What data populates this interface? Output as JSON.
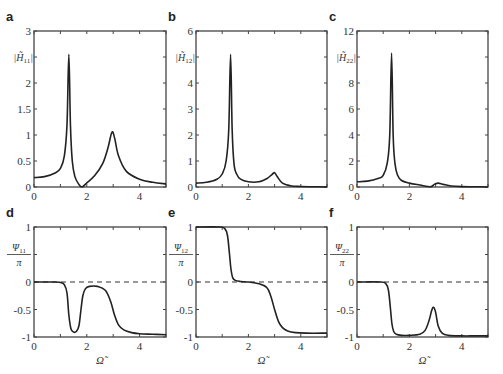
{
  "chart_data": [
    {
      "panel": "a",
      "type": "line",
      "ylabel": "|H̃11|",
      "xlabel": "",
      "xlim": [
        0,
        5
      ],
      "ylim": [
        0,
        3
      ],
      "xticks": [
        "0",
        "2",
        "4"
      ],
      "yticks": [
        "0",
        "0.5",
        "1",
        "1.5",
        "2",
        "2.5",
        "3"
      ],
      "x": [
        0,
        0.4,
        0.8,
        1.0,
        1.15,
        1.25,
        1.32,
        1.38,
        1.45,
        1.55,
        1.7,
        1.82,
        2.0,
        2.3,
        2.6,
        2.8,
        2.95,
        3.05,
        3.2,
        3.5,
        4.0,
        4.5,
        5.0
      ],
      "y": [
        0.18,
        0.2,
        0.27,
        0.36,
        0.6,
        1.2,
        2.55,
        1.2,
        0.5,
        0.2,
        0.05,
        0.0,
        0.08,
        0.22,
        0.45,
        0.75,
        1.05,
        0.95,
        0.6,
        0.3,
        0.15,
        0.09,
        0.06
      ]
    },
    {
      "panel": "b",
      "type": "line",
      "ylabel": "|H̃12|",
      "xlabel": "",
      "xlim": [
        0,
        5
      ],
      "ylim": [
        0,
        6
      ],
      "xticks": [
        "0",
        "2",
        "4"
      ],
      "yticks": [
        "0",
        "1",
        "2",
        "3",
        "4",
        "5",
        "6"
      ],
      "x": [
        0,
        0.4,
        0.8,
        1.0,
        1.15,
        1.25,
        1.32,
        1.38,
        1.45,
        1.55,
        1.7,
        2.0,
        2.4,
        2.7,
        2.9,
        3.0,
        3.1,
        3.3,
        3.6,
        4.0,
        4.5,
        5.0
      ],
      "y": [
        0.15,
        0.18,
        0.3,
        0.5,
        1.0,
        2.2,
        5.1,
        2.2,
        0.9,
        0.5,
        0.3,
        0.2,
        0.2,
        0.32,
        0.48,
        0.55,
        0.4,
        0.15,
        0.05,
        0.02,
        0.01,
        0.0
      ],
      "peak_x": 1.32,
      "peak_y": 5.1
    },
    {
      "panel": "c",
      "type": "line",
      "ylabel": "|H̃22|",
      "xlabel": "",
      "xlim": [
        0,
        5
      ],
      "ylim": [
        0,
        12
      ],
      "xticks": [
        "0",
        "2",
        "4"
      ],
      "yticks": [
        "0",
        "2",
        "4",
        "6",
        "8",
        "10",
        "12"
      ],
      "x": [
        0,
        0.4,
        0.8,
        1.0,
        1.15,
        1.25,
        1.32,
        1.38,
        1.45,
        1.55,
        1.7,
        2.0,
        2.4,
        2.8,
        2.95,
        3.1,
        3.3,
        3.6,
        4.0,
        4.5,
        5.0
      ],
      "y": [
        0.4,
        0.45,
        0.65,
        0.9,
        1.8,
        4.0,
        10.3,
        4.0,
        1.8,
        0.9,
        0.5,
        0.3,
        0.15,
        0.02,
        0.2,
        0.3,
        0.2,
        0.08,
        0.03,
        0.02,
        0.0
      ]
    },
    {
      "panel": "d",
      "type": "line",
      "ylabel": "Ψ11/π",
      "xlabel": "Ω̃",
      "xlim": [
        0,
        5
      ],
      "ylim": [
        -1,
        1
      ],
      "xticks": [
        "0",
        "2",
        "4"
      ],
      "yticks": [
        "-1",
        "-0.5",
        "0",
        "0.5",
        "1"
      ],
      "reference_line": {
        "y": 0,
        "style": "dashed"
      },
      "x": [
        0,
        0.8,
        1.0,
        1.15,
        1.25,
        1.32,
        1.4,
        1.5,
        1.6,
        1.7,
        1.78,
        1.85,
        1.95,
        2.1,
        2.4,
        2.7,
        2.9,
        3.05,
        3.2,
        3.4,
        3.7,
        4.0,
        4.5,
        5.0
      ],
      "y": [
        0,
        0,
        -0.01,
        -0.05,
        -0.2,
        -0.6,
        -0.85,
        -0.91,
        -0.9,
        -0.8,
        -0.5,
        -0.25,
        -0.12,
        -0.08,
        -0.08,
        -0.15,
        -0.35,
        -0.6,
        -0.78,
        -0.87,
        -0.92,
        -0.94,
        -0.95,
        -0.96
      ]
    },
    {
      "panel": "e",
      "type": "line",
      "ylabel": "Ψ12/π",
      "xlabel": "Ω̃",
      "xlim": [
        0,
        5
      ],
      "ylim": [
        -1,
        1
      ],
      "xticks": [
        "0",
        "2",
        "4"
      ],
      "yticks": [
        "-1",
        "-0.5",
        "0",
        "0.5",
        "1"
      ],
      "reference_line": {
        "y": 0,
        "style": "dashed"
      },
      "x": [
        0,
        0.9,
        1.1,
        1.2,
        1.28,
        1.33,
        1.4,
        1.5,
        1.7,
        2.0,
        2.4,
        2.7,
        2.85,
        3.0,
        3.15,
        3.3,
        3.5,
        3.8,
        4.2,
        5.0
      ],
      "y": [
        1.0,
        1.0,
        0.97,
        0.85,
        0.5,
        0.25,
        0.08,
        0.03,
        0.01,
        0.0,
        -0.03,
        -0.1,
        -0.25,
        -0.5,
        -0.72,
        -0.83,
        -0.89,
        -0.92,
        -0.93,
        -0.93
      ]
    },
    {
      "panel": "f",
      "type": "line",
      "ylabel": "Ψ22/π",
      "xlabel": "Ω̃",
      "xlim": [
        0,
        5
      ],
      "ylim": [
        -1,
        1
      ],
      "xticks": [
        "0",
        "2",
        "4"
      ],
      "yticks": [
        "-1",
        "-0.5",
        "0",
        "0.5",
        "1"
      ],
      "reference_line": {
        "y": 0,
        "style": "dashed"
      },
      "x": [
        0,
        0.9,
        1.1,
        1.2,
        1.28,
        1.33,
        1.4,
        1.5,
        1.7,
        2.0,
        2.4,
        2.6,
        2.75,
        2.85,
        2.92,
        3.0,
        3.1,
        3.25,
        3.5,
        4.0,
        4.5,
        5.0
      ],
      "y": [
        0,
        0,
        -0.03,
        -0.15,
        -0.5,
        -0.75,
        -0.9,
        -0.95,
        -0.97,
        -0.97,
        -0.95,
        -0.88,
        -0.7,
        -0.52,
        -0.46,
        -0.55,
        -0.8,
        -0.93,
        -0.97,
        -0.98,
        -0.98,
        -0.98
      ]
    }
  ],
  "panels": {
    "a": {
      "letter": "a",
      "ylabel_main": "|H̃",
      "ylabel_sub": "11",
      "ylabel_end": "|"
    },
    "b": {
      "letter": "b",
      "ylabel_main": "|H̃",
      "ylabel_sub": "12",
      "ylabel_end": "|"
    },
    "c": {
      "letter": "c",
      "ylabel_main": "|H̃",
      "ylabel_sub": "22",
      "ylabel_end": "|"
    },
    "d": {
      "letter": "d",
      "ylabel_num": "Ψ",
      "ylabel_sub": "11",
      "ylabel_den": "π",
      "xlabel": "Ω̃"
    },
    "e": {
      "letter": "e",
      "ylabel_num": "Ψ",
      "ylabel_sub": "12",
      "ylabel_den": "π",
      "xlabel": "Ω̃"
    },
    "f": {
      "letter": "f",
      "ylabel_num": "Ψ",
      "ylabel_sub": "22",
      "ylabel_den": "π",
      "xlabel": "Ω̃"
    }
  }
}
